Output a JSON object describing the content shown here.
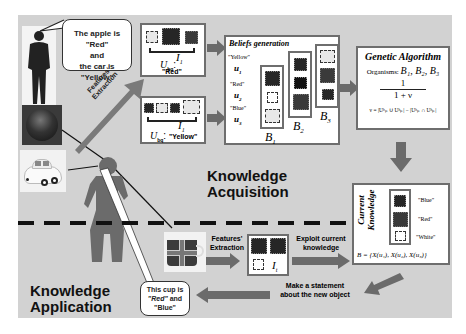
{
  "speech_bubble_top": {
    "line1": "The apple is \"Red\"",
    "line2": "and",
    "line3": "the car is \"Yellow\""
  },
  "features_extraction_top": {
    "line1": "Features'",
    "line2": "Extraction"
  },
  "instance_box_1": {
    "index_label": "I",
    "index_sub": "1",
    "u_label": "U",
    "u_sub": "bq",
    "colon": ":",
    "value": "\"Red\""
  },
  "instance_box_2": {
    "index_label": "I",
    "index_sub": "1",
    "u_label": "U",
    "u_sub": "bq",
    "colon": ":",
    "value": "\"Yellow\""
  },
  "beliefs": {
    "title": "Beliefs generation",
    "labels": [
      {
        "color": "\"Yellow\"",
        "var": "u",
        "sub": "1"
      },
      {
        "color": "\"Red\"",
        "var": "u",
        "sub": "2"
      },
      {
        "color": "\"Blue\"",
        "var": "u",
        "sub": "3"
      }
    ],
    "groups": [
      {
        "name": "B",
        "sub": "1"
      },
      {
        "name": "B",
        "sub": "2"
      },
      {
        "name": "B",
        "sub": "3"
      }
    ]
  },
  "genetic": {
    "title": "Genetic Algorithm",
    "organisms_label": "Organisms:",
    "organisms": "B₁, B₂, B₃",
    "numerator": "1",
    "denominator": "1 + ν",
    "nu_formula": "ν = |Uᵇₚ ∪ Uᵇₚ| − |Uᵇₚ ∩ Uᵇₚ|"
  },
  "knowledge_acquisition": {
    "line1": "Knowledge",
    "line2": "Acquisition"
  },
  "current_knowledge": {
    "title_line1": "Current",
    "title_line2": "Knowledge",
    "items": [
      "\"Blue\"",
      "\"Red\"",
      "\"White\""
    ],
    "formula": "B = {X(u₁), X(u₂), X(u₃)}"
  },
  "application": {
    "features_line1": "Features'",
    "features_line2": "Extraction",
    "index_label": "I",
    "index_sub": "t",
    "exploit_line1": "Exploit current",
    "exploit_line2": "knowledge",
    "statement_line1": "Make a statement",
    "statement_line2": "about the new object",
    "bubble_line1": "This cup is",
    "bubble_red": "\"Red\"",
    "bubble_and": " and",
    "bubble_line3": "\"Blue\""
  },
  "knowledge_application": {
    "line1": "Knowledge",
    "line2": "Application"
  },
  "colors": {
    "panel_bg": "#d2d2d2",
    "arrow": "#6b6b6b",
    "box_border": "#6e6e6e",
    "dark_square": "#262626"
  }
}
